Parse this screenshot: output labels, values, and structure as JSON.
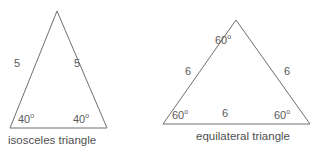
{
  "figure": {
    "background_color": "#ffffff",
    "stroke_color": "#6e6e6e",
    "text_color": "#5a5a5a",
    "caption_color": "#4f4f4f"
  },
  "triangles": [
    {
      "id": "isosceles",
      "caption": "isosceles triangle",
      "side_labels": {
        "left": "5",
        "right": "5"
      },
      "angle_labels": {
        "bottom_left": "40",
        "bottom_left_degree": "o",
        "bottom_right": "40",
        "bottom_right_degree": "o"
      }
    },
    {
      "id": "equilateral",
      "caption": "equilateral triangle",
      "side_labels": {
        "left": "6",
        "right": "6",
        "bottom": "6"
      },
      "angle_labels": {
        "apex": "60",
        "apex_degree": "o",
        "bottom_left": "60",
        "bottom_left_degree": "o",
        "bottom_right": "60",
        "bottom_right_degree": "o"
      }
    }
  ]
}
